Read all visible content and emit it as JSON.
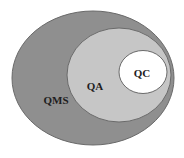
{
  "diagram": {
    "type": "nested-venn",
    "colors": {
      "background": "#ffffff",
      "qms_fill": "#8f8f8f",
      "qa_fill": "#c6c6c6",
      "qc_fill": "#ffffff",
      "stroke": "#6a6a6a",
      "text": "#1e1e1e"
    },
    "sets": [
      {
        "id": "qms",
        "label": "QMS",
        "contains": [
          "qa"
        ]
      },
      {
        "id": "qa",
        "label": "QA",
        "contains": [
          "qc"
        ]
      },
      {
        "id": "qc",
        "label": "QC",
        "contains": []
      }
    ]
  }
}
